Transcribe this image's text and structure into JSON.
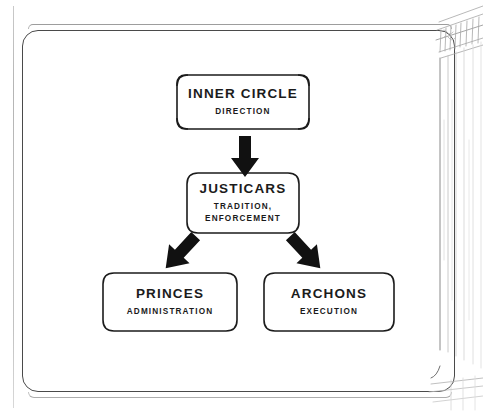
{
  "page": {
    "background_color": "#ffffff",
    "frame": {
      "name": "decorative-page-border",
      "stroke_color": "#4a4a4a"
    },
    "margin_art": {
      "name": "architectural-column-sketch",
      "description": "pencil sketch of a classical column with capital along the right page edge",
      "stroke_color": "#9a9a9a"
    }
  },
  "diagram": {
    "type": "hierarchy",
    "text_color": "#1b1b1b",
    "node_border_color": "#1b1b1b",
    "node_fill_color": "#ffffff",
    "arrow_color": "#111111",
    "nodes": [
      {
        "id": "inner-circle",
        "title": "INNER CIRCLE",
        "subtitle_lines": [
          "DIRECTION"
        ],
        "level": 1
      },
      {
        "id": "justicars",
        "title": "JUSTICARS",
        "subtitle_lines": [
          "TRADITION,",
          "ENFORCEMENT"
        ],
        "level": 2
      },
      {
        "id": "princes",
        "title": "PRINCES",
        "subtitle_lines": [
          "ADMINISTRATION"
        ],
        "level": 3
      },
      {
        "id": "archons",
        "title": "ARCHONS",
        "subtitle_lines": [
          "EXECUTION"
        ],
        "level": 3
      }
    ],
    "edges": [
      {
        "id": "inner-to-justicars",
        "from": "inner-circle",
        "to": "justicars",
        "direction": "down"
      },
      {
        "id": "justicars-to-princes",
        "from": "justicars",
        "to": "princes",
        "direction": "down-left"
      },
      {
        "id": "justicars-to-archons",
        "from": "justicars",
        "to": "archons",
        "direction": "down-right"
      }
    ]
  }
}
